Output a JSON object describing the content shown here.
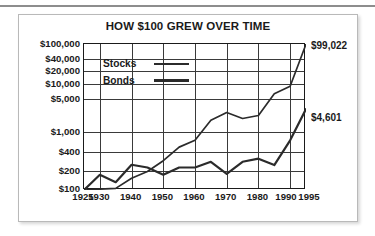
{
  "figure": {
    "title": "HOW $100 GREW OVER TIME"
  },
  "legend": {
    "items": [
      {
        "label": "Stocks",
        "swatch_name": "stocks-line-swatch"
      },
      {
        "label": "Bonds",
        "swatch_name": "bonds-line-swatch"
      }
    ]
  },
  "annotations": [
    {
      "name": "stocks-end-value",
      "text": "$99,022"
    },
    {
      "name": "bonds-end-value",
      "text": "$4,601"
    }
  ],
  "colors": {
    "line": "#2b2b2b",
    "grid": "#3a3a3a",
    "frame": "#1a1a1a",
    "box_border": "#b9b9b9",
    "rule": "#8d8d8d",
    "background": "#ffffff"
  },
  "chart_data": {
    "type": "line",
    "title": "HOW $100 GREW OVER TIME",
    "xlabel": "",
    "ylabel": "",
    "yscale": "log",
    "ylim": [
      100,
      100000
    ],
    "xlim": [
      1925,
      1995
    ],
    "grid": true,
    "legend_position": "inside-top-left",
    "ytick_values": [
      100,
      200,
      400,
      1000,
      5000,
      10000,
      20000,
      40000,
      100000
    ],
    "ytick_labels": [
      "$100",
      "$200",
      "$400",
      "$1,000",
      "$5,000",
      "$10,000",
      "$20,000",
      "$40,000",
      "$100,000"
    ],
    "xtick_values": [
      1925,
      1930,
      1940,
      1950,
      1960,
      1970,
      1980,
      1990,
      1995
    ],
    "xtick_labels": [
      "1925",
      "1930",
      "1940",
      "1950",
      "1960",
      "1970",
      "1980",
      "1990",
      "1995"
    ],
    "end_labels": {
      "Stocks": "$99,022",
      "Bonds": "$4,601"
    },
    "series": [
      {
        "name": "Stocks",
        "x": [
          1925,
          1930,
          1935,
          1940,
          1945,
          1950,
          1955,
          1960,
          1965,
          1970,
          1975,
          1980,
          1985,
          1990,
          1995
        ],
        "values": [
          100,
          104,
          108,
          175,
          240,
          400,
          760,
          1050,
          2700,
          3900,
          2950,
          3400,
          9500,
          13500,
          99022
        ]
      },
      {
        "name": "Bonds",
        "x": [
          1925,
          1930,
          1935,
          1940,
          1945,
          1950,
          1955,
          1960,
          1965,
          1970,
          1975,
          1980,
          1985,
          1990,
          1995
        ],
        "values": [
          100,
          205,
          145,
          330,
          290,
          205,
          290,
          290,
          380,
          215,
          380,
          440,
          325,
          1050,
          4601
        ]
      }
    ]
  }
}
